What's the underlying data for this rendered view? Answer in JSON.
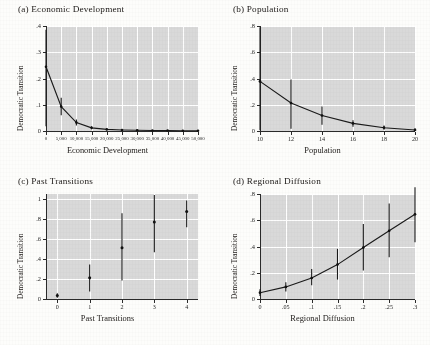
{
  "figure": {
    "ylabel_common": "Democratic Transition",
    "panel_bg": "#d9d9d9",
    "line_color": "#1a1a1a",
    "page_bg": "#fdfdfb"
  },
  "chart_data": [
    {
      "type": "line",
      "panel": "a",
      "title": "(a) Economic Development",
      "xlabel": "Economic Development",
      "ylabel": "Democratic Transition",
      "xlim": [
        0,
        50000
      ],
      "ylim": [
        0,
        0.4
      ],
      "xticks": [
        0,
        5000,
        10000,
        15000,
        20000,
        25000,
        30000,
        35000,
        40000,
        45000,
        50000
      ],
      "xticklabels": [
        "0",
        "5,000",
        "10,000",
        "15,000",
        "20,000",
        "25,000",
        "30,000",
        "35,000",
        "40,000",
        "45,000",
        "50,000"
      ],
      "yticks": [
        0,
        0.1,
        0.2,
        0.3,
        0.4
      ],
      "yticklabels": [
        "0",
        ".1",
        ".2",
        ".3",
        ".4"
      ],
      "grid": true,
      "legend": "none",
      "x": [
        0,
        5000,
        10000,
        15000,
        20000,
        25000,
        30000,
        35000,
        40000,
        45000,
        50000
      ],
      "values": [
        0.245,
        0.093,
        0.032,
        0.012,
        0.006,
        0.004,
        0.003,
        0.002,
        0.002,
        0.001,
        0.001
      ],
      "ci_lower": [
        0.018,
        0.06,
        0.021,
        0.007,
        0.003,
        0.002,
        0.001,
        0.001,
        0.001,
        0.0,
        0.0
      ],
      "ci_upper": [
        0.386,
        0.127,
        0.044,
        0.018,
        0.009,
        0.006,
        0.005,
        0.004,
        0.003,
        0.003,
        0.002
      ]
    },
    {
      "type": "line",
      "panel": "b",
      "title": "(b) Population",
      "xlabel": "Population",
      "ylabel": "Democratic Transition",
      "xlim": [
        10,
        20
      ],
      "ylim": [
        0,
        0.8
      ],
      "xticks": [
        10,
        12,
        14,
        16,
        18,
        20
      ],
      "xticklabels": [
        "10",
        "12",
        "14",
        "16",
        "18",
        "20"
      ],
      "yticks": [
        0,
        0.2,
        0.4,
        0.6,
        0.8
      ],
      "yticklabels": [
        "0",
        ".2",
        ".4",
        ".6",
        ".8"
      ],
      "grid": true,
      "legend": "none",
      "x": [
        10,
        12,
        14,
        16,
        18,
        20
      ],
      "values": [
        0.378,
        0.213,
        0.118,
        0.058,
        0.025,
        0.008
      ],
      "ci_lower": [
        0.005,
        0.017,
        0.047,
        0.032,
        0.01,
        0.0
      ],
      "ci_upper": [
        0.79,
        0.392,
        0.187,
        0.082,
        0.041,
        0.019
      ]
    },
    {
      "type": "scatter",
      "panel": "c",
      "title": "(c) Past Transitions",
      "xlabel": "Past Transitions",
      "ylabel": "Democratic Transition",
      "xlim": [
        -0.35,
        4.35
      ],
      "ylim": [
        0,
        1.05
      ],
      "xticks": [
        0,
        1,
        2,
        3,
        4
      ],
      "xticklabels": [
        "0",
        "1",
        "2",
        "3",
        "4"
      ],
      "yticks": [
        0,
        0.2,
        0.4,
        0.6,
        0.8,
        1
      ],
      "yticklabels": [
        "0",
        ".2",
        ".4",
        ".6",
        ".8",
        "1"
      ],
      "grid": true,
      "legend": "none",
      "x": [
        0,
        1,
        2,
        3,
        4
      ],
      "values": [
        0.035,
        0.212,
        0.512,
        0.77,
        0.875
      ],
      "ci_lower": [
        0.012,
        0.075,
        0.185,
        0.468,
        0.718
      ],
      "ci_upper": [
        0.058,
        0.345,
        0.858,
        1.04,
        0.985
      ]
    },
    {
      "type": "line",
      "panel": "d",
      "title": "(d) Regional Diffusion",
      "xlabel": "Regional Diffusion",
      "ylabel": "Democratic Transition",
      "xlim": [
        0,
        0.3
      ],
      "ylim": [
        0,
        0.8
      ],
      "xticks": [
        0,
        0.05,
        0.1,
        0.15,
        0.2,
        0.25,
        0.3
      ],
      "xticklabels": [
        "0",
        ".05",
        ".1",
        ".15",
        ".2",
        ".25",
        ".3"
      ],
      "yticks": [
        0,
        0.2,
        0.4,
        0.6,
        0.8
      ],
      "yticklabels": [
        "0",
        ".2",
        ".4",
        ".6",
        ".8"
      ],
      "grid": true,
      "legend": "none",
      "x": [
        0,
        0.05,
        0.1,
        0.15,
        0.2,
        0.25,
        0.3
      ],
      "values": [
        0.048,
        0.092,
        0.16,
        0.262,
        0.392,
        0.52,
        0.645
      ],
      "ci_lower": [
        0.022,
        0.058,
        0.105,
        0.148,
        0.218,
        0.318,
        0.432
      ],
      "ci_upper": [
        0.075,
        0.128,
        0.228,
        0.382,
        0.572,
        0.728,
        0.852
      ]
    }
  ]
}
